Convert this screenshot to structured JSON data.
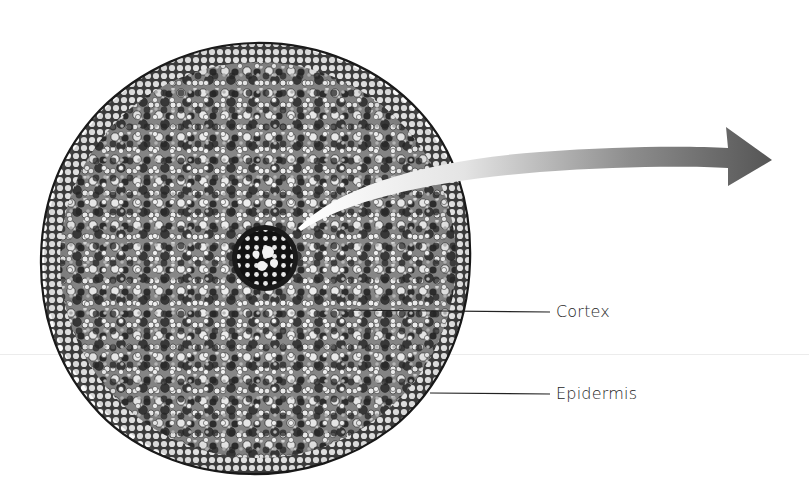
{
  "figure": {
    "arrow_direction": "right",
    "colors": {
      "background": "#ffffff",
      "tissue_dark": "#3a3a3a",
      "tissue_light": "#f2f2f2",
      "arrow_start": "#f5f5f5",
      "arrow_end": "#555555",
      "leader_line": "#222222"
    }
  },
  "labels": [
    {
      "id": "cortex",
      "text": "Cortex"
    },
    {
      "id": "epidermis",
      "text": "Epidermis"
    }
  ]
}
